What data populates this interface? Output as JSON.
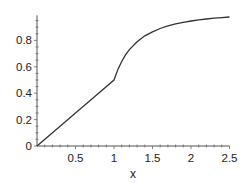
{
  "chart_data": {
    "type": "line",
    "title": "",
    "xlabel": "x",
    "ylabel": "",
    "xlim": [
      0,
      2.5
    ],
    "ylim": [
      0,
      1.0
    ],
    "grid": false,
    "legend": null,
    "xticks": [
      {
        "value": 0.5,
        "label": "0.5"
      },
      {
        "value": 1,
        "label": "1"
      },
      {
        "value": 1.5,
        "label": "1.5"
      },
      {
        "value": 2,
        "label": "2"
      },
      {
        "value": 2.5,
        "label": "2.5"
      }
    ],
    "yticks": [
      {
        "value": 0,
        "label": "0"
      },
      {
        "value": 0.2,
        "label": "0.2"
      },
      {
        "value": 0.4,
        "label": "0.4"
      },
      {
        "value": 0.6,
        "label": "0.6"
      },
      {
        "value": 0.8,
        "label": "0.8"
      }
    ],
    "series": [
      {
        "name": "f(x)",
        "color": "#333333",
        "x": [
          0,
          0.25,
          0.5,
          0.75,
          1.0,
          1.05,
          1.1,
          1.15,
          1.2,
          1.3,
          1.4,
          1.5,
          1.6,
          1.7,
          1.8,
          1.9,
          2.0,
          2.1,
          2.2,
          2.3,
          2.4,
          2.5
        ],
        "y": [
          0,
          0.125,
          0.25,
          0.375,
          0.5,
          0.58,
          0.64,
          0.69,
          0.73,
          0.79,
          0.835,
          0.865,
          0.89,
          0.91,
          0.925,
          0.937,
          0.947,
          0.955,
          0.962,
          0.968,
          0.973,
          0.977
        ]
      }
    ]
  }
}
